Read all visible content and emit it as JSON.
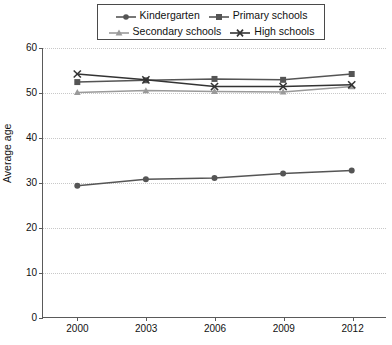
{
  "chart_data": {
    "type": "line",
    "title": "",
    "xlabel": "",
    "ylabel": "Average age",
    "categories": [
      "2000",
      "2003",
      "2006",
      "2009",
      "2012"
    ],
    "x": [
      2000,
      2003,
      2006,
      2009,
      2012
    ],
    "xlim": [
      1998.5,
      2013.5
    ],
    "ylim": [
      0,
      60
    ],
    "yticks": [
      0,
      10,
      20,
      30,
      40,
      50,
      60
    ],
    "grid": true,
    "legend_position": "top-center",
    "series": [
      {
        "name": "Kindergarten",
        "marker": "circle",
        "color": "#555555",
        "values": [
          29.3,
          30.7,
          31.0,
          32.0,
          32.7
        ]
      },
      {
        "name": "Primary schools",
        "marker": "square",
        "color": "#555555",
        "values": [
          52.4,
          52.8,
          53.1,
          52.9,
          54.2
        ]
      },
      {
        "name": "Secondary schools",
        "marker": "triangle",
        "color": "#9a9a9a",
        "values": [
          50.1,
          50.5,
          50.3,
          50.2,
          51.4
        ]
      },
      {
        "name": "High schools",
        "marker": "x",
        "color": "#333333",
        "values": [
          54.2,
          52.9,
          51.4,
          51.4,
          51.8
        ]
      }
    ]
  },
  "legend": {
    "rows": [
      [
        "Kindergarten",
        "Primary schools"
      ],
      [
        "Secondary schools",
        "High schools"
      ]
    ]
  },
  "axis": {
    "y_title": "Average age",
    "y_tick_labels": [
      "0",
      "10",
      "20",
      "30",
      "40",
      "50",
      "60"
    ],
    "x_tick_labels": [
      "2000",
      "2003",
      "2006",
      "2009",
      "2012"
    ]
  },
  "colors": {
    "kindergarten": "#555555",
    "primary": "#555555",
    "secondary": "#9a9a9a",
    "high": "#333333",
    "axis": "#5a5a5a",
    "grid": "#c8c8c8"
  }
}
